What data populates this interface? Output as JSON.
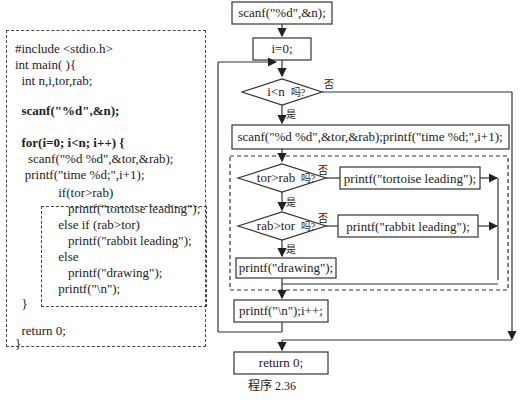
{
  "code": {
    "lines": [
      {
        "text": "#include <stdio.h>",
        "bold": false
      },
      {
        "text": "int main( ){",
        "bold": false
      },
      {
        "text": "  int n,i,tor,rab;",
        "bold": false
      },
      {
        "text": "",
        "bold": false
      },
      {
        "text": "  scanf(\"%d\",&n);",
        "bold": true
      },
      {
        "text": "",
        "bold": false
      },
      {
        "text": "  for(i=0; i<n; i++) {",
        "bold": true
      },
      {
        "text": "    scanf(\"%d %d\",&tor,&rab);",
        "bold": false
      },
      {
        "text": "   printf(\"time %d;\",i+1);",
        "bold": false
      },
      {
        "text": "     if(tor>rab)",
        "bold": false
      },
      {
        "text": "        printf(\"tortoise leading\");",
        "bold": false
      },
      {
        "text": "     else if (rab>tor)",
        "bold": false
      },
      {
        "text": "        printf(\"rabbit leading\");",
        "bold": false
      },
      {
        "text": "     else",
        "bold": false
      },
      {
        "text": "        printf(\"drawing\");",
        "bold": false
      },
      {
        "text": "     printf(\"\\n\");",
        "bold": false
      },
      {
        "text": "  }",
        "bold": false
      },
      {
        "text": "  return 0;",
        "bold": false
      },
      {
        "text": "}",
        "bold": false
      }
    ]
  },
  "flowchart": {
    "nodes": {
      "scanf_n": "scanf(\"%d\",&n);",
      "init_i": "i=0;",
      "cond_loop": "i<n",
      "cond_loop_q": "吗?",
      "read_pair": "scanf(\"%d %d\",&tor,&rab);printf(\"time %d;\",i+1);",
      "cond_tor": "tor>rab",
      "cond_tor_q": "吗?",
      "print_tortoise": "printf(\"tortoise leading\");",
      "cond_rab": "rab>tor",
      "cond_rab_q": "吗?",
      "print_rabbit": "printf(\"rabbit leading\");",
      "print_drawing": "printf(\"drawing\");",
      "print_newline": "printf(\"\\n\");i++;",
      "return": "return 0;"
    },
    "labels": {
      "yes": "是",
      "no": "否"
    }
  },
  "caption": "程序 2.36"
}
